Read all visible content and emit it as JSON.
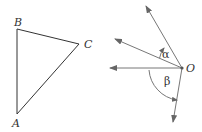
{
  "left_figure": {
    "type": "triangle",
    "vertices": [
      {
        "label": "A",
        "x": 17,
        "y": 114
      },
      {
        "label": "B",
        "x": 17,
        "y": 29
      },
      {
        "label": "C",
        "x": 79,
        "y": 44
      }
    ]
  },
  "right_figure": {
    "type": "rays-from-point",
    "origin": {
      "label": "O",
      "x": 182,
      "y": 68
    },
    "rays": [
      {
        "name": "upper-ray",
        "tip_x": 146,
        "tip_y": 6
      },
      {
        "name": "upper-left-ray",
        "tip_x": 115,
        "tip_y": 39
      },
      {
        "name": "left-ray",
        "tip_x": 110,
        "tip_y": 68
      },
      {
        "name": "lower-ray",
        "tip_x": 173,
        "tip_y": 122
      }
    ],
    "angles": [
      {
        "label": "α",
        "between": [
          "upper-left-ray",
          "upper-ray"
        ]
      },
      {
        "label": "β",
        "between": [
          "left-ray",
          "lower-ray"
        ]
      }
    ]
  },
  "colors": {
    "line": "#333333",
    "ray": "#777777"
  }
}
